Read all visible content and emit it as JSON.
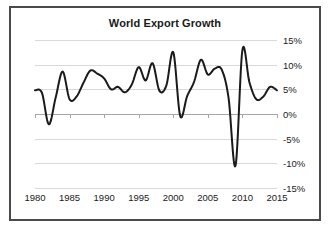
{
  "chart_data": {
    "type": "line",
    "title": "World Export Growth",
    "xlabel": "",
    "ylabel": "",
    "grid": true,
    "legend": false,
    "y_axis_position": "right",
    "ylim": [
      -15,
      15
    ],
    "xlim": [
      1980,
      2015
    ],
    "ytick_labels": [
      "15%",
      "10%",
      "5%",
      "0%",
      "-5%",
      "-10%",
      "-15%"
    ],
    "ytick_values": [
      15,
      10,
      5,
      0,
      -5,
      -10,
      -15
    ],
    "xtick_labels": [
      "1980",
      "1985",
      "1990",
      "1995",
      "2000",
      "2005",
      "2010",
      "2015"
    ],
    "xtick_values": [
      1980,
      1985,
      1990,
      1995,
      2000,
      2005,
      2010,
      2015
    ],
    "series": [
      {
        "name": "World Export Growth",
        "color": "#1a1a1a",
        "x": [
          1980,
          1981,
          1982,
          1983,
          1984,
          1985,
          1986,
          1987,
          1988,
          1989,
          1990,
          1991,
          1992,
          1993,
          1994,
          1995,
          1996,
          1997,
          1998,
          1999,
          2000,
          2001,
          2002,
          2003,
          2004,
          2005,
          2006,
          2007,
          2008,
          2009,
          2010,
          2011,
          2012,
          2013,
          2014,
          2015
        ],
        "values": [
          4.8,
          4.3,
          -2.1,
          3.4,
          8.6,
          3.0,
          3.5,
          6.3,
          8.8,
          8.2,
          7.2,
          5.0,
          5.5,
          4.4,
          6.0,
          9.5,
          6.8,
          10.3,
          4.7,
          5.8,
          12.5,
          -0.4,
          3.6,
          6.5,
          11.0,
          8.0,
          9.2,
          9.0,
          3.2,
          -10.5,
          13.0,
          6.5,
          3.0,
          3.5,
          5.5,
          4.8
        ]
      }
    ]
  },
  "axis": {
    "y_labels": [
      "15%",
      "10%",
      "5%",
      "0%",
      "-5%",
      "-10%",
      "-15%"
    ],
    "x_labels": [
      "1980",
      "1985",
      "1990",
      "1995",
      "2000",
      "2005",
      "2010",
      "2015"
    ]
  }
}
